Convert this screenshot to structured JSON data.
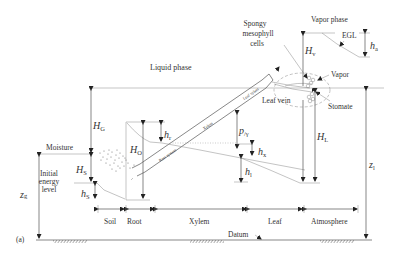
{
  "labels": {
    "liquid_phase": "Liquid phase",
    "vapor_phase": "Vapor phase",
    "spongy_line1": "Spongy",
    "spongy_line2": "mesophyll",
    "spongy_line3": "cells",
    "egl": "EGL",
    "vapor": "Vapor",
    "stomate": "Stomate",
    "leaf_vein": "Leaf vein",
    "moisture": "Moisture",
    "initial_line1": "Initial",
    "initial_line2": "energy",
    "initial_line3": "level",
    "datum": "Datum",
    "panel": "(a)",
    "root_system": "Root system",
    "xylem_tube": "Xylem",
    "leaf_tube": "Leaf xylem"
  },
  "symbols": {
    "HG": {
      "main": "H",
      "sub": "G"
    },
    "HO": {
      "main": "H",
      "sub": "O"
    },
    "hr": {
      "main": "h",
      "sub": "r"
    },
    "HS": {
      "main": "H",
      "sub": "S"
    },
    "hS": {
      "main": "h",
      "sub": "S"
    },
    "zg": {
      "main": "z",
      "sub": "g"
    },
    "pgamma": {
      "main": "p",
      "sub": "/γ"
    },
    "hx": {
      "main": "h",
      "sub": "x"
    },
    "hl": {
      "main": "h",
      "sub": "l"
    },
    "Hv": {
      "main": "H",
      "sub": "v"
    },
    "ha": {
      "main": "h",
      "sub": "a"
    },
    "HL": {
      "main": "H",
      "sub": "L"
    },
    "zl": {
      "main": "z",
      "sub": "l"
    }
  },
  "segments": [
    {
      "label": "Soil"
    },
    {
      "label": "Root"
    },
    {
      "label": "Xylem"
    },
    {
      "label": "Leaf"
    },
    {
      "label": "Atmosphere"
    }
  ],
  "colors": {
    "line": "#555555",
    "text": "#333333",
    "background": "#ffffff"
  }
}
